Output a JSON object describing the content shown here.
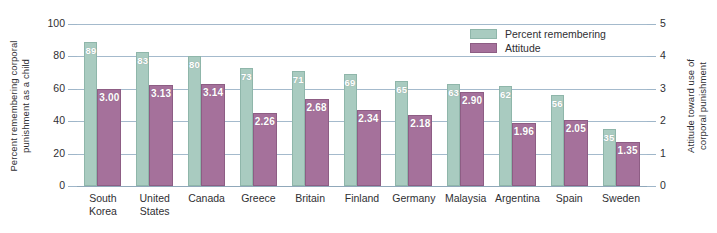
{
  "chart_data": {
    "type": "bar",
    "title": "",
    "subtitle": "",
    "categories": [
      "South\nKorea",
      "United\nStates",
      "Canada",
      "Greece",
      "Britain",
      "Finland",
      "Germany",
      "Malaysia",
      "Argentina",
      "Spain",
      "Sweden"
    ],
    "series": [
      {
        "name": "Percent remembering",
        "axis": "left",
        "color": "#a9cbc0",
        "values": [
          89,
          83,
          80,
          73,
          71,
          69,
          65,
          63,
          62,
          56,
          35
        ],
        "labels": [
          "89",
          "83",
          "80",
          "73",
          "71",
          "69",
          "65",
          "63",
          "62",
          "56",
          "35"
        ]
      },
      {
        "name": "Attitude",
        "axis": "right",
        "color": "#a5719b",
        "values": [
          3.0,
          3.13,
          3.14,
          2.26,
          2.68,
          2.34,
          2.18,
          2.9,
          1.96,
          2.05,
          1.35
        ],
        "labels": [
          "3.00",
          "3.13",
          "3.14",
          "2.26",
          "2.68",
          "2.34",
          "2.18",
          "2.90",
          "1.96",
          "2.05",
          "1.35"
        ]
      }
    ],
    "xlabel": "",
    "ylabel": "Percent remembering corporal\npunishment as a child",
    "y2label": "Attitude toward use of\ncorporal punishment",
    "ylim": [
      0,
      100
    ],
    "y2lim": [
      0,
      5
    ],
    "yticks": [
      "100",
      "80",
      "60",
      "40",
      "20",
      "0"
    ],
    "ytick_values": [
      100,
      80,
      60,
      40,
      20,
      0
    ],
    "y2ticks": [
      "5",
      "4",
      "3",
      "2",
      "1",
      "0"
    ],
    "y2tick_values": [
      5,
      4,
      3,
      2,
      1,
      0
    ],
    "grid": true,
    "legend_position": "top-right",
    "legend": [
      {
        "label": "Percent remembering",
        "color": "#a9cbc0"
      },
      {
        "label": "Attitude",
        "color": "#a5719b"
      }
    ]
  },
  "colors": {
    "green": "#a9cbc0",
    "green_edge": "#8fb6aa",
    "purple": "#a5719b",
    "purple_edge": "#8d5d84",
    "gridline": "#9fb6c9",
    "text": "#2f2f33",
    "value_text": "#ffffff",
    "background": "#ffffff"
  }
}
